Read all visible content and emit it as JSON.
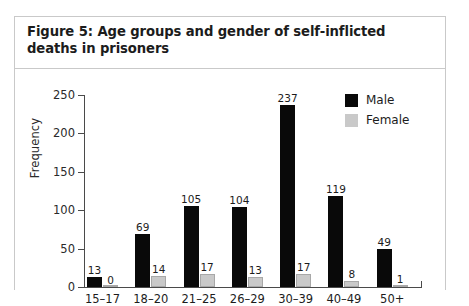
{
  "figure": {
    "title": "Figure 5: Age groups and gender of self-inflicted deaths in prisoners"
  },
  "legend": {
    "position": "top-right",
    "entries": [
      {
        "label": "Male",
        "color": "#090909"
      },
      {
        "label": "Female",
        "color": "#c9c9c9"
      }
    ]
  },
  "axes": {
    "ylabel": "Frequency",
    "yticks": [
      "0",
      "50",
      "100",
      "150",
      "200",
      "250"
    ]
  },
  "chart_data": {
    "type": "bar",
    "title": "Figure 5: Age groups and gender of self-inflicted deaths in prisoners",
    "xlabel": "",
    "ylabel": "Frequency",
    "ylim": [
      0,
      250
    ],
    "yticks": [
      0,
      50,
      100,
      150,
      200,
      250
    ],
    "grid": false,
    "legend_position": "top-right",
    "categories": [
      "15–17",
      "18–20",
      "21–25",
      "26–29",
      "30–39",
      "40–49",
      "50+"
    ],
    "series": [
      {
        "name": "Male",
        "color": "#090909",
        "values": [
          13,
          69,
          105,
          104,
          237,
          119,
          49
        ]
      },
      {
        "name": "Female",
        "color": "#c9c9c9",
        "values": [
          0,
          14,
          17,
          13,
          17,
          8,
          1
        ]
      }
    ]
  }
}
